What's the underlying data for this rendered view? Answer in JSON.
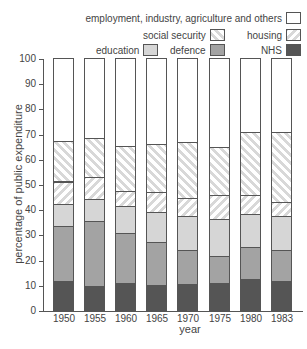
{
  "chart_data": {
    "type": "bar",
    "stacked": true,
    "title": "",
    "xlabel": "year",
    "ylabel": "percentage of public expenditure",
    "ylim": [
      0,
      100
    ],
    "yticks": [
      0,
      10,
      20,
      30,
      40,
      50,
      60,
      70,
      80,
      90,
      100
    ],
    "grid": false,
    "legend_position": "top-right",
    "categories": [
      "1950",
      "1955",
      "1960",
      "1965",
      "1970",
      "1975",
      "1980",
      "1983"
    ],
    "series": [
      {
        "name": "NHS",
        "pattern": "solid-dark",
        "color": "#555555",
        "values": [
          11.5,
          9.5,
          10.6,
          9.9,
          10.4,
          10.7,
          12.3,
          11.4
        ]
      },
      {
        "name": "defence",
        "pattern": "solid-mid",
        "color": "#a3a3a3",
        "values": [
          22.0,
          25.7,
          20.0,
          17.0,
          13.4,
          10.8,
          12.6,
          12.4
        ]
      },
      {
        "name": "education",
        "pattern": "solid-light",
        "color": "#d6d6d6",
        "values": [
          8.5,
          8.8,
          10.8,
          12.1,
          13.5,
          14.7,
          13.2,
          13.6
        ]
      },
      {
        "name": "housing",
        "pattern": "hatch-back",
        "color": "#d8d8d8",
        "values": [
          9.0,
          8.8,
          5.9,
          7.7,
          7.0,
          9.6,
          7.5,
          5.6
        ]
      },
      {
        "name": "social security",
        "pattern": "hatch-forward",
        "color": "#d8d8d8",
        "values": [
          16.0,
          15.3,
          17.9,
          19.2,
          22.2,
          18.8,
          24.9,
          27.8
        ]
      },
      {
        "name": "employment, industry, agriculture and others",
        "pattern": "white",
        "color": "#ffffff",
        "values": [
          33.0,
          31.9,
          34.8,
          34.1,
          33.5,
          35.4,
          29.5,
          29.2
        ]
      }
    ]
  },
  "legend": {
    "other": "employment, industry, agriculture and others",
    "ss": "social security",
    "housing": "housing",
    "education": "education",
    "defence": "defence",
    "nhs": "NHS"
  },
  "axis": {
    "xlabel": "year",
    "ylabel": "percentage of public expenditure",
    "yticks": [
      "0",
      "10",
      "20",
      "30",
      "40",
      "50",
      "60",
      "70",
      "80",
      "90",
      "100"
    ],
    "xticks": [
      "1950",
      "1955",
      "1960",
      "1965",
      "1970",
      "1975",
      "1980",
      "1983"
    ]
  }
}
